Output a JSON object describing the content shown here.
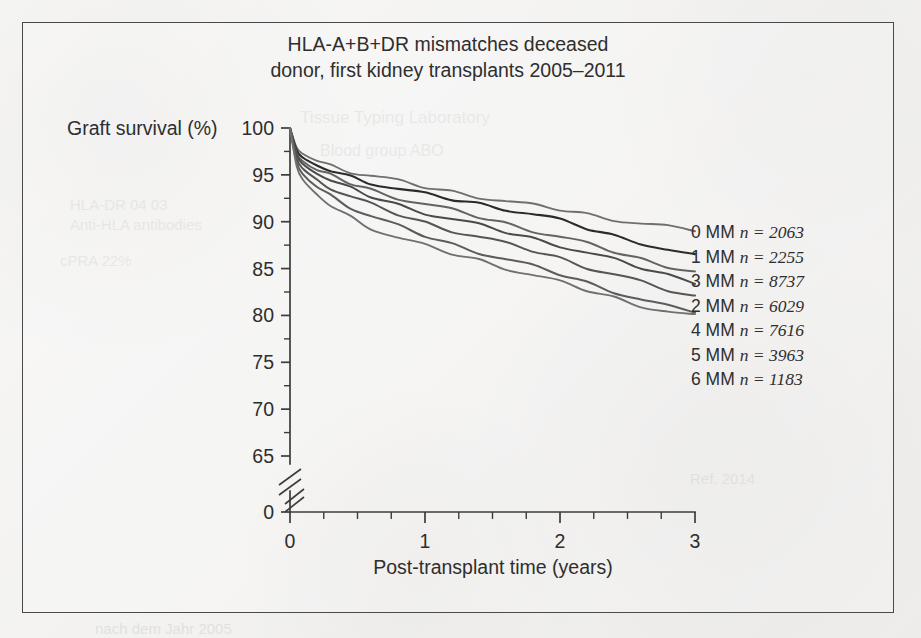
{
  "figure": {
    "title_line1": "HLA-A+B+DR mismatches deceased",
    "title_line2": "donor, first kidney transplants 2005–2011",
    "y_axis_title": "Graft survival (%)",
    "x_axis_title": "Post-transplant time (years)"
  },
  "chart_data": {
    "type": "line",
    "title": "HLA-A+B+DR mismatches deceased donor, first kidney transplants 2005–2011",
    "xlabel": "Post-transplant time (years)",
    "ylabel": "Graft survival (%)",
    "xlim": [
      0,
      3
    ],
    "ylim": [
      65,
      100
    ],
    "y_axis_break": true,
    "y_break_label": "0",
    "grid": false,
    "legend_position": "right",
    "x_ticks": [
      "0",
      "1",
      "2",
      "3"
    ],
    "x_tick_values": [
      0,
      1,
      2,
      3
    ],
    "x_minor_step": 0.25,
    "y_ticks": [
      "100",
      "95",
      "90",
      "85",
      "80",
      "75",
      "70",
      "65",
      "0"
    ],
    "y_tick_values": [
      100,
      95,
      90,
      85,
      80,
      75,
      70,
      65
    ],
    "y_minor_step": 2.5,
    "x": [
      0,
      0.05,
      0.1,
      0.2,
      0.3,
      0.45,
      0.6,
      0.8,
      1.0,
      1.2,
      1.4,
      1.6,
      1.8,
      2.0,
      2.2,
      2.4,
      2.6,
      2.8,
      3.0
    ],
    "series": [
      {
        "name": "0 MM",
        "label": "0 MM",
        "n": 2063,
        "n_text": "n = 2063",
        "color": "#6f6f6f",
        "width": 1.9,
        "values": [
          100,
          97.9,
          97.2,
          96.5,
          96.0,
          95.4,
          94.9,
          94.3,
          93.7,
          93.2,
          92.7,
          92.2,
          91.7,
          91.3,
          90.8,
          90.3,
          89.8,
          89.4,
          89.1
        ]
      },
      {
        "name": "1 MM",
        "label": "1 MM",
        "n": 2255,
        "n_text": "n = 2255",
        "color": "#2b2b2b",
        "width": 2.1,
        "values": [
          100,
          97.6,
          96.8,
          96.0,
          95.5,
          94.8,
          94.2,
          93.5,
          92.9,
          92.4,
          91.9,
          91.4,
          90.8,
          90.1,
          89.3,
          88.5,
          87.8,
          87.0,
          86.3
        ]
      },
      {
        "name": "3 MM",
        "label": "3 MM",
        "n": 8737,
        "n_text": "n = 8737",
        "color": "#636363",
        "width": 2.0,
        "values": [
          100,
          97.3,
          96.4,
          95.5,
          94.9,
          94.1,
          93.4,
          92.6,
          91.9,
          91.2,
          90.5,
          89.8,
          89.1,
          88.4,
          87.6,
          86.8,
          86.0,
          85.3,
          84.7
        ]
      },
      {
        "name": "2 MM",
        "label": "2 MM",
        "n": 6029,
        "n_text": "n = 6029",
        "color": "#4a4a4a",
        "width": 2.0,
        "values": [
          100,
          97.1,
          96.1,
          95.1,
          94.4,
          93.5,
          92.7,
          91.8,
          91.0,
          90.3,
          89.6,
          88.9,
          88.2,
          87.5,
          86.7,
          85.9,
          85.1,
          84.3,
          83.6
        ]
      },
      {
        "name": "4 MM",
        "label": "4 MM",
        "n": 7616,
        "n_text": "n = 7616",
        "color": "#555555",
        "width": 2.0,
        "values": [
          100,
          96.7,
          95.6,
          94.5,
          93.7,
          92.7,
          91.8,
          90.8,
          89.9,
          89.1,
          88.4,
          87.6,
          86.9,
          86.1,
          85.2,
          84.4,
          83.5,
          82.7,
          82.0
        ]
      },
      {
        "name": "5 MM",
        "label": "5 MM",
        "n": 3963,
        "n_text": "n = 3963",
        "color": "#5c5c5c",
        "width": 2.0,
        "values": [
          100,
          96.3,
          95.0,
          93.7,
          92.8,
          91.6,
          90.6,
          89.5,
          88.5,
          87.6,
          86.8,
          86.0,
          85.2,
          84.4,
          83.5,
          82.6,
          81.7,
          80.9,
          80.4
        ]
      },
      {
        "name": "6 MM",
        "label": "6 MM",
        "n": 1183,
        "n_text": "n = 1183",
        "color": "#707070",
        "width": 1.9,
        "values": [
          100,
          95.9,
          94.4,
          92.9,
          91.8,
          90.5,
          89.4,
          88.3,
          87.4,
          86.6,
          85.9,
          85.1,
          84.3,
          83.5,
          82.7,
          81.9,
          81.1,
          80.4,
          79.9
        ]
      }
    ]
  },
  "legend": {
    "entries": [
      {
        "label": "0 MM",
        "n_text": "n = 2063"
      },
      {
        "label": "1 MM",
        "n_text": "n = 2255"
      },
      {
        "label": "3 MM",
        "n_text": "n = 8737"
      },
      {
        "label": "2 MM",
        "n_text": "n = 6029"
      },
      {
        "label": "4 MM",
        "n_text": "n = 7616"
      },
      {
        "label": "5 MM",
        "n_text": "n = 3963"
      },
      {
        "label": "6 MM",
        "n_text": "n = 1183"
      }
    ]
  }
}
